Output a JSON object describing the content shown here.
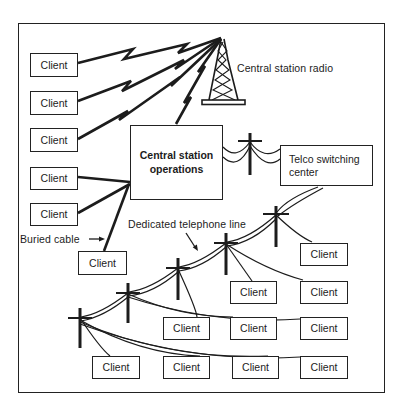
{
  "diagram": {
    "background_color": "#ffffff",
    "line_color": "#1c1c1c",
    "labels": {
      "client": "Client",
      "central_station_operations": "Central station operations",
      "central_station_radio": "Central station radio",
      "telco_switching_center": "Telco switching center",
      "buried_cable": "Buried cable",
      "dedicated_telephone_line": "Dedicated telephone line"
    },
    "counts": {
      "client_boxes": 16,
      "radio_link_clients": 3,
      "buried_cable_clients": 3,
      "telephone_line_clients": 10,
      "telephone_poles": 6
    }
  }
}
